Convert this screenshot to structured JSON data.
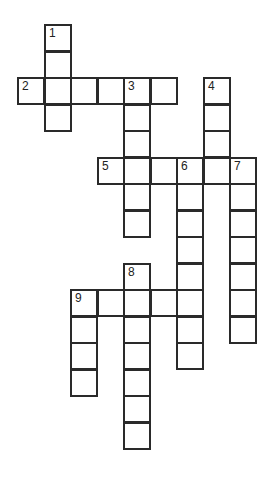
{
  "puzzle": {
    "grid": {
      "origin_x": 17,
      "origin_y": 24,
      "cell_size": 26.5,
      "border_color": "#2a2a2a"
    },
    "words": [
      {
        "number": "1",
        "direction": "down",
        "row": 0,
        "col": 1,
        "length": 4
      },
      {
        "number": "2",
        "direction": "across",
        "row": 2,
        "col": 0,
        "length": 6
      },
      {
        "number": "3",
        "direction": "down",
        "row": 2,
        "col": 4,
        "length": 6
      },
      {
        "number": "4",
        "direction": "down",
        "row": 2,
        "col": 7,
        "length": 4
      },
      {
        "number": "5",
        "direction": "across",
        "row": 5,
        "col": 3,
        "length": 6
      },
      {
        "number": "6",
        "direction": "down",
        "row": 5,
        "col": 6,
        "length": 8
      },
      {
        "number": "7",
        "direction": "down",
        "row": 5,
        "col": 8,
        "length": 7
      },
      {
        "number": "8",
        "direction": "down",
        "row": 9,
        "col": 4,
        "length": 7
      },
      {
        "number": "9",
        "direction": "across",
        "row": 10,
        "col": 2,
        "length": 5
      },
      {
        "number": "9",
        "direction": "down",
        "row": 10,
        "col": 2,
        "length": 4
      }
    ]
  }
}
